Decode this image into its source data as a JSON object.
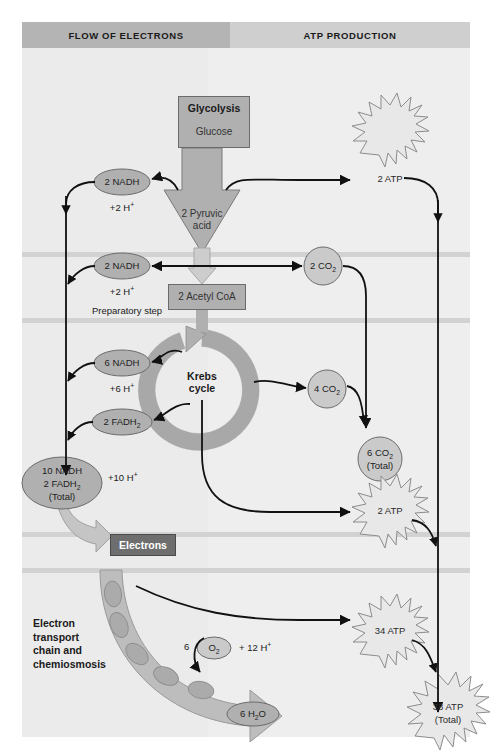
{
  "diagram": {
    "title_hidden": "",
    "headers": {
      "left": "FLOW OF ELECTRONS",
      "right": "ATP PRODUCTION"
    },
    "glycolysis": {
      "title": "Glycolysis",
      "substrate": "Glucose",
      "product": "2 Pyruvic acid",
      "product_line1": "2 Pyruvic",
      "product_line2": "acid"
    },
    "prep_step": {
      "label": "Preparatory step",
      "product": "2 Acetyl CoA"
    },
    "krebs": {
      "line1": "Krebs",
      "line2": "cycle"
    },
    "etc": {
      "electrons_box": "Electrons",
      "label_line1": "Electron",
      "label_line2": "transport",
      "label_line3": "chain and",
      "label_line4": "chemiosmosis"
    },
    "carriers": [
      {
        "name": "glycolysis-nadh",
        "label": "2 NADH",
        "protons": "+2 H+"
      },
      {
        "name": "prep-nadh",
        "label": "2 NADH",
        "protons": "+2 H+"
      },
      {
        "name": "krebs-nadh",
        "label": "6 NADH",
        "protons": "+6 H+"
      },
      {
        "name": "krebs-fadh2",
        "label": "2 FADH2",
        "protons": ""
      }
    ],
    "carrier_total": {
      "line1": "10 NADH",
      "line2": "2 FADH2",
      "line3": "(Total)",
      "protons": "+10 H+"
    },
    "oxygen": {
      "count": "6",
      "label": "O2",
      "protons": "+ 12 H+",
      "water": "6 H2O"
    },
    "co2": [
      {
        "name": "prep-co2",
        "label": "2 CO2"
      },
      {
        "name": "krebs-co2",
        "label": "4 CO2"
      }
    ],
    "co2_total": {
      "line1": "6 CO2",
      "line2": "(Total)"
    },
    "atp": [
      {
        "name": "glycolysis-atp",
        "label": "2 ATP"
      },
      {
        "name": "krebs-atp",
        "label": "2 ATP"
      },
      {
        "name": "etc-atp",
        "label": "34 ATP"
      }
    ],
    "atp_total": {
      "line1": "38 ATP",
      "line2": "(Total)"
    },
    "colors": {
      "panel_bg": "#ebebeb",
      "header_left": "#b4b4b4",
      "header_right": "#cfcfcf",
      "gray_fill": "#b0b0b0",
      "dark_box": "#6e6e6e",
      "band": "#d2d2d2",
      "burst_fill": "#e8e8e8",
      "stroke": "#1a1a1a"
    }
  }
}
